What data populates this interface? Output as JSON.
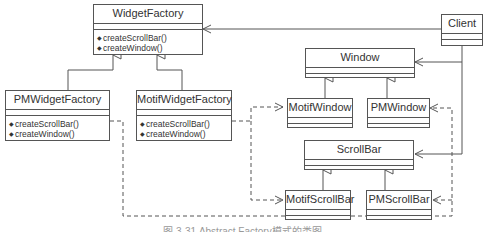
{
  "diagram": {
    "caption": "图 3-31  Abstract Factory模式的类图",
    "classes": {
      "widget_factory": {
        "name": "WidgetFactory",
        "ops": [
          "createScrollBar()",
          "createWindow()"
        ]
      },
      "pm_widget_factory": {
        "name": "PMWidgetFactory",
        "ops": [
          "createScrollBar()",
          "createWindow()"
        ]
      },
      "motif_widget_factory": {
        "name": "MotifWidgetFactory",
        "ops": [
          "createScrollBar()",
          "createWindow()"
        ]
      },
      "client": {
        "name": "Client"
      },
      "window": {
        "name": "Window"
      },
      "motif_window": {
        "name": "MotifWindow"
      },
      "pm_window": {
        "name": "PMWindow"
      },
      "scrollbar": {
        "name": "ScrollBar"
      },
      "motif_scrollbar": {
        "name": "MotifScrollBar"
      },
      "pm_scrollbar": {
        "name": "PMScrollBar"
      }
    },
    "relations": [
      {
        "type": "generalization",
        "from": "PMWidgetFactory",
        "to": "WidgetFactory"
      },
      {
        "type": "generalization",
        "from": "MotifWidgetFactory",
        "to": "WidgetFactory"
      },
      {
        "type": "generalization",
        "from": "MotifWindow",
        "to": "Window"
      },
      {
        "type": "generalization",
        "from": "PMWindow",
        "to": "Window"
      },
      {
        "type": "generalization",
        "from": "MotifScrollBar",
        "to": "ScrollBar"
      },
      {
        "type": "generalization",
        "from": "PMScrollBar",
        "to": "ScrollBar"
      },
      {
        "type": "association",
        "from": "Client",
        "to": "WidgetFactory"
      },
      {
        "type": "association",
        "from": "Client",
        "to": "Window"
      },
      {
        "type": "association",
        "from": "Client",
        "to": "ScrollBar"
      },
      {
        "type": "dependency",
        "from": "MotifWidgetFactory",
        "to": "MotifWindow"
      },
      {
        "type": "dependency",
        "from": "MotifWidgetFactory",
        "to": "MotifScrollBar"
      },
      {
        "type": "dependency",
        "from": "PMWidgetFactory",
        "to": "PMWindow"
      },
      {
        "type": "dependency",
        "from": "PMWidgetFactory",
        "to": "PMScrollBar"
      }
    ]
  }
}
